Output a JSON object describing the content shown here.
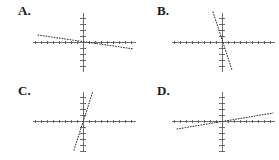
{
  "figure": {
    "background_color": "#ffffff",
    "line_color": "#3a3a3a",
    "axis_color": "#4a4a4a",
    "label_color": "#1a1a1a",
    "panel_count": 4
  },
  "panels": [
    {
      "id": "a",
      "label": "A.",
      "origin": {
        "x": 83,
        "y": 42
      },
      "x_axis": {
        "start": 33,
        "end": 136,
        "y": 42,
        "tick_spacing": 6,
        "tick_size": 3
      },
      "y_axis": {
        "start": 13,
        "end": 72,
        "x": 83,
        "tick_spacing": 6,
        "tick_size": 3
      },
      "line": {
        "x1": 38,
        "y1": 35,
        "x2": 134,
        "y2": 49,
        "style": "dotted"
      }
    },
    {
      "id": "b",
      "label": "B.",
      "origin": {
        "x": 222,
        "y": 42
      },
      "x_axis": {
        "start": 172,
        "end": 275,
        "y": 42,
        "tick_spacing": 6,
        "tick_size": 3
      },
      "y_axis": {
        "start": 13,
        "end": 72,
        "x": 222,
        "tick_spacing": 6,
        "tick_size": 3
      },
      "line": {
        "x1": 213,
        "y1": 12,
        "x2": 232,
        "y2": 70,
        "style": "dotted"
      }
    },
    {
      "id": "c",
      "label": "C.",
      "origin": {
        "x": 83,
        "y": 121
      },
      "x_axis": {
        "start": 33,
        "end": 136,
        "y": 121,
        "tick_spacing": 6,
        "tick_size": 3
      },
      "y_axis": {
        "start": 92,
        "end": 152,
        "x": 83,
        "tick_spacing": 6,
        "tick_size": 3
      },
      "line": {
        "x1": 74,
        "y1": 150,
        "x2": 93,
        "y2": 91,
        "style": "dotted"
      }
    },
    {
      "id": "d",
      "label": "D.",
      "origin": {
        "x": 222,
        "y": 121
      },
      "x_axis": {
        "start": 172,
        "end": 275,
        "y": 121,
        "tick_spacing": 6,
        "tick_size": 3
      },
      "y_axis": {
        "start": 92,
        "end": 152,
        "x": 222,
        "tick_spacing": 6,
        "tick_size": 3
      },
      "line": {
        "x1": 177,
        "y1": 129,
        "x2": 273,
        "y2": 113,
        "style": "dotted"
      }
    }
  ],
  "chart_data": {
    "type": "line",
    "title": "",
    "xlabel": "",
    "ylabel": "",
    "panels": [
      {
        "label": "A.",
        "type": "line",
        "series": [
          {
            "name": "line-a",
            "style": "dotted",
            "slope": -0.146,
            "intercept": 0.0,
            "x": [
              -7.5,
              8.5
            ],
            "y": [
              1.1,
              -1.2
            ],
            "description": "shallow negative slope, falls left to right"
          }
        ],
        "xlim": [
          -8.3,
          8.8
        ],
        "ylim": [
          -5.0,
          4.8
        ],
        "grid": false,
        "legend": "none",
        "tick_interval": 1
      },
      {
        "label": "B.",
        "type": "line",
        "series": [
          {
            "name": "line-b",
            "style": "dotted",
            "slope": -3.05,
            "intercept": 0.0,
            "x": [
              -1.5,
              1.7
            ],
            "y": [
              5.0,
              -4.7
            ],
            "description": "steep negative slope, falls sharply left to right"
          }
        ],
        "xlim": [
          -8.3,
          8.8
        ],
        "ylim": [
          -5.0,
          4.8
        ],
        "grid": false,
        "legend": "none",
        "tick_interval": 1
      },
      {
        "label": "C.",
        "type": "line",
        "series": [
          {
            "name": "line-c",
            "style": "dotted",
            "slope": 3.1,
            "intercept": 0.0,
            "x": [
              -1.5,
              1.7
            ],
            "y": [
              -4.8,
              5.0
            ],
            "description": "steep positive slope, rises sharply left to right"
          }
        ],
        "xlim": [
          -8.3,
          8.8
        ],
        "ylim": [
          -4.8,
          4.8
        ],
        "grid": false,
        "legend": "none",
        "tick_interval": 1
      },
      {
        "label": "D.",
        "type": "line",
        "series": [
          {
            "name": "line-d",
            "style": "dotted",
            "slope": 0.167,
            "intercept": 0.0,
            "x": [
              -7.5,
              8.5
            ],
            "y": [
              -1.3,
              1.3
            ],
            "description": "shallow positive slope, rises gently left to right"
          }
        ],
        "xlim": [
          -8.3,
          8.8
        ],
        "ylim": [
          -4.8,
          4.8
        ],
        "grid": false,
        "legend": "none",
        "tick_interval": 1
      }
    ]
  }
}
